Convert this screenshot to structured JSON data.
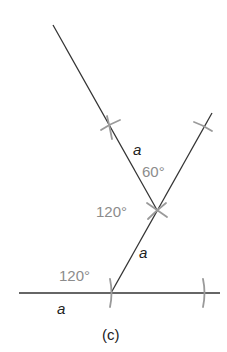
{
  "figure": {
    "caption": "(c)",
    "side_labels": {
      "upper": "a",
      "middle": "a",
      "bottom": "a"
    },
    "angle_labels": {
      "top": "60°",
      "middle": "120°",
      "bottom": "120°"
    },
    "colors": {
      "line": "#333333",
      "construction_mark": "#9a9a9a",
      "angle_text": "#8c8c8c"
    }
  }
}
